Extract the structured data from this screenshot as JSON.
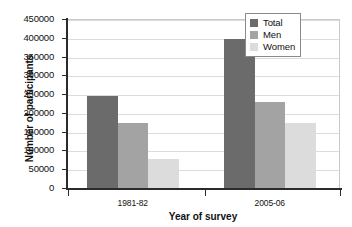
{
  "chart_data": {
    "type": "bar",
    "title": "",
    "xlabel": "Year of survey",
    "ylabel": "Number of participants",
    "categories": [
      "1981-82",
      "2005-06"
    ],
    "series": [
      {
        "name": "Total",
        "values": [
          246000,
          396000
        ],
        "color": "#6b6b6b"
      },
      {
        "name": "Men",
        "values": [
          173000,
          228000
        ],
        "color": "#a3a3a3"
      },
      {
        "name": "Women",
        "values": [
          77000,
          172000
        ],
        "color": "#dcdcdc"
      }
    ],
    "ylim": [
      0,
      450000
    ],
    "ytick_step": 50000,
    "yticks": [
      0,
      50000,
      100000,
      150000,
      200000,
      250000,
      300000,
      350000,
      400000,
      450000
    ],
    "ytick_labels": [
      "0",
      "50000",
      "100000",
      "150000",
      "200000",
      "250000",
      "300000",
      "350000",
      "400000",
      "450000"
    ],
    "grid": true,
    "grid_axis": "y",
    "legend_position": "top-right",
    "legend_entries": [
      "Total",
      "Men",
      "Women"
    ],
    "background": "#ffffff",
    "axis_color": "#2b2b2b",
    "gridline_color": "#dcdcdc"
  }
}
